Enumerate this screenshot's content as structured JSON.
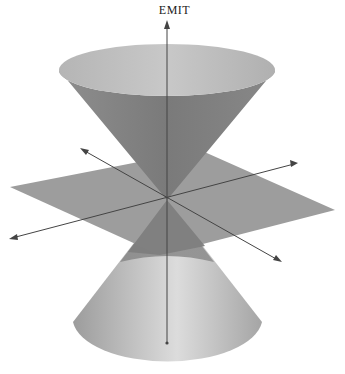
{
  "figure": {
    "title": "EMIT",
    "colors": {
      "background": "#ffffff",
      "plane": "#9a9a9a",
      "cone_outer_dark": "#7d7d7d",
      "cone_inner_light": "#bdbdbd",
      "axis": "#444444"
    }
  }
}
